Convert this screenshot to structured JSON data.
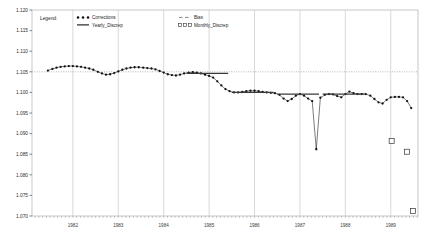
{
  "chart_data": {
    "type": "line",
    "title": "",
    "xlabel": "",
    "ylabel": "",
    "xlim": [
      1981.6,
      1990.1
    ],
    "ylim": [
      1.07,
      1.12
    ],
    "ytick_step": 0.005,
    "grid": "vertical year gridlines plus dotted reference line at 1.105",
    "legend_position": "top-left inside plot",
    "legend_title": "Legend:",
    "reference_line_y": 1.105,
    "ytick_labels": [
      "1.070",
      "1.075",
      "1.080",
      "1.085",
      "1.090",
      "1.095",
      "1.100",
      "1.105",
      "1.110",
      "1.115",
      "1.120"
    ],
    "ytick_values": [
      1.07,
      1.075,
      1.08,
      1.085,
      1.09,
      1.095,
      1.1,
      1.105,
      1.11,
      1.115,
      1.12
    ],
    "xtick_labels": [
      "1982",
      "1983",
      "1984",
      "1985",
      "1986",
      "1987",
      "1988",
      "1989"
    ],
    "xtick_values": [
      1982,
      1983,
      1984,
      1985,
      1986,
      1987,
      1988,
      1989
    ],
    "legend_entries": [
      {
        "label": "Corrections",
        "marker": "filled-circle",
        "style": "dotted-markers",
        "color": "#111111"
      },
      {
        "label": "Yearly_Discrep",
        "marker": "none",
        "style": "solid-line",
        "color": "#111111"
      },
      {
        "label": "Bias",
        "marker": "none",
        "style": "dashed-line",
        "color": "#777777"
      },
      {
        "label": "Monthly_Discrep",
        "marker": "open-square",
        "style": "markers",
        "color": "#333333"
      }
    ],
    "series": [
      {
        "name": "Corrections",
        "marker": "filled-circle",
        "x": [
          1981.95,
          1982.05,
          1982.14,
          1982.23,
          1982.32,
          1982.41,
          1982.5,
          1982.59,
          1982.68,
          1982.77,
          1982.86,
          1982.95,
          1983.05,
          1983.14,
          1983.23,
          1983.32,
          1983.41,
          1983.5,
          1983.59,
          1983.68,
          1983.77,
          1983.86,
          1983.95,
          1984.05,
          1984.14,
          1984.23,
          1984.32,
          1984.41,
          1984.5,
          1984.59,
          1984.68,
          1984.77,
          1984.86,
          1984.95,
          1985.05,
          1985.14,
          1985.23,
          1985.32,
          1985.41,
          1985.5,
          1985.59,
          1985.68,
          1985.77,
          1985.86,
          1985.95,
          1986.05,
          1986.14,
          1986.23,
          1986.32,
          1986.41,
          1986.5,
          1986.59,
          1986.68,
          1986.77,
          1986.86,
          1986.95,
          1987.05,
          1987.14,
          1987.23,
          1987.32,
          1987.41,
          1987.5,
          1987.59,
          1987.68,
          1987.77,
          1987.86,
          1987.95,
          1988.05,
          1988.14,
          1988.23,
          1988.32,
          1988.41,
          1988.5,
          1988.59,
          1988.68,
          1988.77,
          1988.86,
          1988.95,
          1989.05,
          1989.14,
          1989.23,
          1989.32,
          1989.41,
          1989.5,
          1989.59,
          1989.68,
          1989.77,
          1989.86,
          1989.95
        ],
        "y": [
          1.1053,
          1.1057,
          1.106,
          1.1062,
          1.1063,
          1.1064,
          1.1064,
          1.1063,
          1.1062,
          1.106,
          1.1058,
          1.1055,
          1.105,
          1.1046,
          1.1043,
          1.1044,
          1.1047,
          1.1051,
          1.1055,
          1.1058,
          1.106,
          1.1061,
          1.1061,
          1.106,
          1.1059,
          1.1058,
          1.1056,
          1.1052,
          1.1048,
          1.1044,
          1.1042,
          1.1041,
          1.1043,
          1.1046,
          1.1048,
          1.1049,
          1.1048,
          1.1046,
          1.1043,
          1.104,
          1.1036,
          1.1027,
          1.1017,
          1.1008,
          1.1003,
          1.1,
          1.1,
          1.1001,
          1.1003,
          1.1004,
          1.1004,
          1.1003,
          1.1001,
          1.1,
          1.0999,
          1.0998,
          1.0994,
          1.0985,
          1.0979,
          1.0984,
          1.0992,
          1.0996,
          1.0992,
          1.0985,
          1.0979,
          1.0862,
          1.0987,
          1.0994,
          1.0996,
          1.0995,
          1.0991,
          1.0988,
          1.0996,
          1.1002,
          1.0998,
          1.0996,
          1.0996,
          1.0996,
          1.0992,
          1.0984,
          1.0976,
          1.0973,
          1.0982,
          1.0988,
          1.0989,
          1.0989,
          1.0988,
          1.0979,
          1.0962
        ]
      },
      {
        "name": "Yearly_Discrep",
        "style": "solid-horizontal-segments",
        "segments": [
          {
            "x0": 1985.0,
            "x1": 1985.92,
            "y": 1.1046
          },
          {
            "x0": 1986.0,
            "x1": 1986.92,
            "y": 1.1
          },
          {
            "x0": 1987.0,
            "x1": 1987.92,
            "y": 1.0996
          },
          {
            "x0": 1988.0,
            "x1": 1988.92,
            "y": 1.0996
          }
        ]
      },
      {
        "name": "Monthly_Discrep",
        "marker": "open-square",
        "x": [
          1989.52,
          1989.86,
          1989.99
        ],
        "y": [
          1.0882,
          1.0856,
          1.0712
        ]
      }
    ]
  }
}
